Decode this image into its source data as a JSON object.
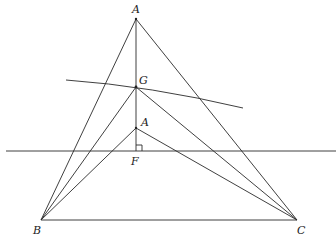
{
  "diagram": {
    "points": {
      "A_top": {
        "label": "A",
        "x": 136,
        "y": 19
      },
      "G": {
        "label": "G",
        "x": 136,
        "y": 87
      },
      "A_low": {
        "label": "A",
        "x": 136,
        "y": 128
      },
      "F": {
        "label": "F",
        "x": 136,
        "y": 151
      },
      "B": {
        "label": "B",
        "x": 41,
        "y": 220
      },
      "C": {
        "label": "C",
        "x": 297,
        "y": 220
      }
    },
    "right_angle_marker_at": "F"
  }
}
